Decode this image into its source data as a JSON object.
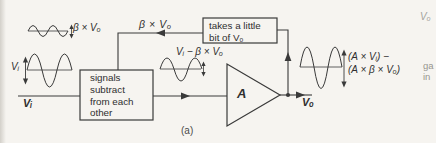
{
  "diagram": {
    "caption": "(a)",
    "boxes": {
      "subtract": {
        "lines": [
          "signals",
          "subtract",
          "from each",
          "other"
        ]
      },
      "feedback": {
        "lines": [
          "takes a little",
          "bit of Vₒ"
        ]
      }
    },
    "amplifier": {
      "label": "A"
    },
    "signals": {
      "input_label": "Vᵢ",
      "input_wave_label": "Vᵢ",
      "output_label": "Vₒ",
      "beta_wave_label": "β × Vₒ",
      "feedback_line_label": "β × Vₒ",
      "error_label": "Vᵢ − β × Vₒ",
      "output_expr_line1": "(A × Vᵢ) −",
      "output_expr_line2": "(A × β × Vₒ)"
    },
    "edge_text": {
      "top_fragment": "Vₒ",
      "gain_fragment_1": "ga",
      "gain_fragment_2": "in"
    },
    "colors": {
      "ink": "#3a3a3a",
      "paper": "#f6f4f0",
      "faded": "#9b9a96"
    }
  }
}
